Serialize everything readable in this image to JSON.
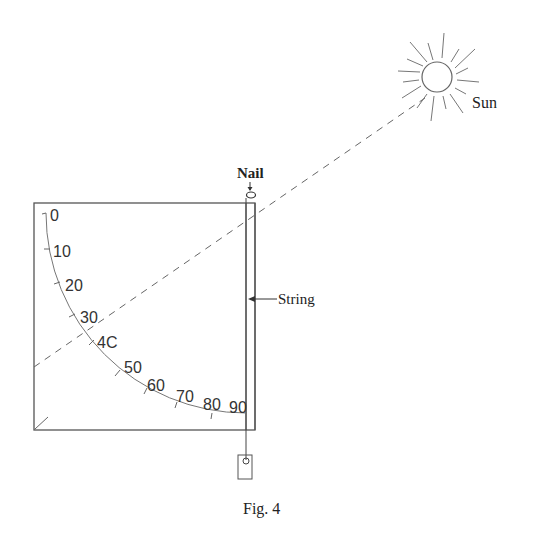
{
  "figure": {
    "caption": "Fig. 4",
    "labels": {
      "sun": "Sun",
      "nail": "Nail",
      "string": "String"
    },
    "scale": {
      "marks": [
        "0",
        "10",
        "20",
        "30",
        "4C",
        "50",
        "60",
        "70",
        "80",
        "90"
      ],
      "unit": "degrees"
    },
    "colors": {
      "ink": "#444444",
      "background": "#ffffff"
    }
  }
}
